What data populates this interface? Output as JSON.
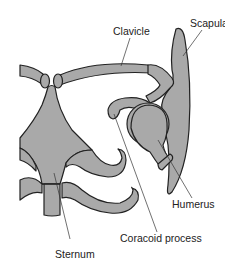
{
  "diagram": {
    "colors": {
      "bone_fill": "#a9a9a9",
      "outline": "#222222",
      "background": "#ffffff"
    },
    "labels": {
      "clavicle": "Clavicle",
      "scapula": "Scapula",
      "humerus": "Humerus",
      "coracoid": "Coracoid process",
      "sternum": "Sternum"
    }
  }
}
